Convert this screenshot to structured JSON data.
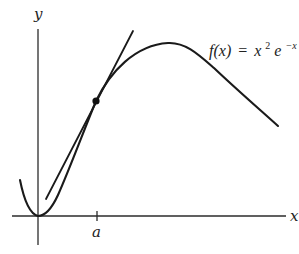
{
  "figure": {
    "formula": {
      "lhs": "f(x)",
      "equals": "=",
      "base": "x",
      "exp1": "2",
      "base2": "e",
      "exp2": "−x"
    },
    "axes": {
      "x_label": "x",
      "y_label": "y"
    },
    "tick": {
      "label": "a"
    },
    "elements": {
      "curve": "graph of f(x) = x²e⁻ˣ",
      "tangent": "tangent line at x = a",
      "point": "point of tangency (a, f(a))"
    },
    "colors": {
      "ink": "#1a1a1a",
      "background": "#ffffff"
    }
  }
}
